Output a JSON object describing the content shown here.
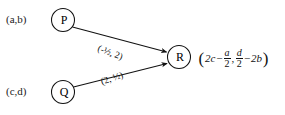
{
  "diagram": {
    "type": "vector-mapping-diagram",
    "background_color": "#ffffff",
    "ink_color": "#111111",
    "nodes": [
      {
        "id": "P",
        "letter": "P",
        "coordinate_label": "(a,b)",
        "cx": 63,
        "cy": 20
      },
      {
        "id": "Q",
        "letter": "Q",
        "coordinate_label": "(c,d)",
        "cx": 63,
        "cy": 92
      },
      {
        "id": "R",
        "letter": "R",
        "coordinate_label": "",
        "cx": 179,
        "cy": 57
      }
    ],
    "edges": [
      {
        "id": "P-to-R",
        "from": "P",
        "to": "R",
        "label": "(-½, 2)",
        "label_parts": {
          "open": "(",
          "first": "-½",
          "comma": ",",
          "second": "2",
          "close": ")"
        }
      },
      {
        "id": "Q-to-R",
        "from": "Q",
        "to": "R",
        "label": "(2, ½)",
        "label_parts": {
          "open": "(",
          "first": "2",
          "comma": ",",
          "second": "½",
          "close": ")"
        }
      }
    ],
    "result_expression": {
      "full_text": "(2c - a/2, d/2 - 2b)",
      "open_paren": "(",
      "x_component": {
        "lead": "2c",
        "operator": "−",
        "fraction": {
          "numerator": "a",
          "denominator": "2"
        }
      },
      "separator": ",",
      "y_component": {
        "fraction": {
          "numerator": "d",
          "denominator": "2"
        },
        "operator": "−",
        "trail": "2b"
      },
      "close_paren": ")"
    }
  }
}
